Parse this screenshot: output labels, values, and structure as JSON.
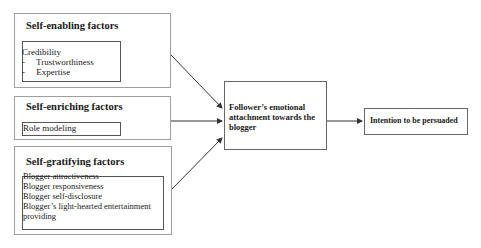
{
  "diagram": {
    "factor_groups": [
      {
        "title": "Self-enabling factors",
        "items": [
          "Credibility",
          "-     Trustworthiness",
          "-     Expertise"
        ]
      },
      {
        "title": "Self-enriching factors",
        "items": [
          "Role modeling"
        ]
      },
      {
        "title": "Self-gratifying factors",
        "items": [
          "Blogger attractiveness",
          "Blogger responsiveness",
          "Blogger self-disclosure",
          "Blogger’s light-hearted entertainment",
          "providing"
        ]
      }
    ],
    "mediator": {
      "lines": [
        "Follower’s emotional",
        "attachment towards the",
        "blogger"
      ]
    },
    "outcome": {
      "label": "Intention to be persuaded"
    },
    "colors": {
      "line": "#333333",
      "outer_border": "#a0a0a0",
      "inner_border": "#555555"
    }
  }
}
